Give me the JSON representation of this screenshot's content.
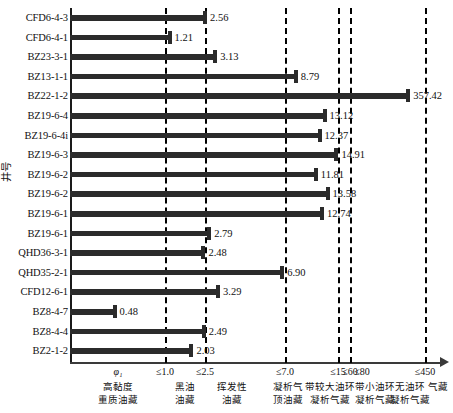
{
  "chart_data": {
    "type": "bar",
    "orientation": "horizontal",
    "title": "",
    "xlabel": "φ₁",
    "ylabel": "井号",
    "grid": false,
    "legend": null,
    "categories": [
      "CFD6-4-3",
      "CFD6-4-1",
      "BZ23-3-1",
      "BZ13-1-1",
      "BZ22-1-2",
      "BZ19-6-4",
      "BZ19-6-4i",
      "BZ19-6-3",
      "BZ19-6-2",
      "BZ19-6-2",
      "BZ19-6-1",
      "BZ19-6-1",
      "QHD36-3-1",
      "QHD35-2-1",
      "CFD12-6-1",
      "BZ8-4-7",
      "BZ8-4-4",
      "BZ2-1-2"
    ],
    "values": [
      2.56,
      1.21,
      3.13,
      8.79,
      357.42,
      13.12,
      12.37,
      14.91,
      11.81,
      13.58,
      12.74,
      2.79,
      2.48,
      6.9,
      3.29,
      0.48,
      2.49,
      2.03
    ],
    "value_labels": [
      "2.56",
      "1.21",
      "3.13",
      "8.79",
      "357.42",
      "13.12",
      "12.37",
      "14.91",
      "11.81",
      "13.58",
      "12.74",
      "2.79",
      "2.48",
      "6.90",
      "3.29",
      "0.48",
      "2.49",
      "2.03"
    ],
    "xticks": [
      "≤1.0",
      "≤2.5",
      "≤7.0",
      "≤15",
      "≤60",
      "≤80",
      "≤450"
    ],
    "xtick_values": [
      1.0,
      2.5,
      7.0,
      15,
      60,
      80,
      450
    ],
    "xtick_px": [
      165,
      205,
      285,
      338,
      350,
      362,
      425
    ],
    "divider_px": [
      165,
      205,
      285,
      338,
      350,
      425
    ],
    "zone_captions": [
      {
        "line1": "高黏度",
        "line2": "重质油藏",
        "center_px": 118
      },
      {
        "line1": "黑油",
        "line2": "油藏",
        "center_px": 185
      },
      {
        "line1": "挥发性",
        "line2": "油藏",
        "center_px": 232
      },
      {
        "line1": "凝析气",
        "line2": "顶油藏",
        "center_px": 288
      },
      {
        "line1": "带较大油环",
        "line2": "凝析气藏",
        "center_px": 330
      },
      {
        "line1": "带小油环",
        "line2": "凝析气藏",
        "center_px": 375
      },
      {
        "line1": "无油环",
        "line2": "凝析气藏",
        "center_px": 410
      },
      {
        "line1": "气藏",
        "line2": "",
        "center_px": 438
      }
    ],
    "colors": {
      "bar": "#2b2b2b",
      "axis": "#1a1a1a",
      "divider": "#000000",
      "background": "#ffffff",
      "text": "#111111"
    },
    "axis_px": {
      "left": 70,
      "top": 8,
      "plot_width": 370,
      "plot_height": 355,
      "row_height": 19.6
    }
  }
}
